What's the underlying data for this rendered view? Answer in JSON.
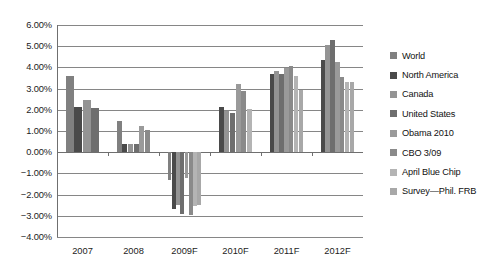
{
  "chart_data": {
    "type": "bar",
    "title": "",
    "subtitle": "",
    "xlabel": "",
    "ylabel": "",
    "ylim": [
      -0.04,
      0.06
    ],
    "ytick_labels": [
      "6.00%",
      "5.00%",
      "4.00%",
      "3.00%",
      "2.00%",
      "1.00%",
      "0.00%",
      "-1.00%",
      "-2.00%",
      "-3.00%",
      "-4.00%"
    ],
    "ytick_values": [
      0.06,
      0.05,
      0.04,
      0.03,
      0.02,
      0.01,
      0.0,
      -0.01,
      -0.02,
      -0.03,
      -0.04
    ],
    "grid": true,
    "legend_position": "right",
    "categories": [
      "2007",
      "2008",
      "2009F",
      "2010F",
      "2011F",
      "2012F"
    ],
    "series": [
      {
        "name": "World",
        "color": "#808080",
        "values": [
          3.6,
          1.45,
          -1.3,
          null,
          null,
          null
        ]
      },
      {
        "name": "North America",
        "color": "#4a4a4a",
        "values": [
          2.15,
          0.4,
          -2.7,
          2.15,
          3.7,
          4.35
        ]
      },
      {
        "name": "Canada",
        "color": "#949494",
        "values": [
          2.45,
          0.4,
          -2.5,
          1.95,
          3.85,
          5.05
        ]
      },
      {
        "name": "United States",
        "color": "#6e6e6e",
        "values": [
          2.1,
          0.4,
          -2.9,
          1.85,
          3.7,
          5.3
        ]
      },
      {
        "name": "Obama 2010",
        "color": "#9a9a9a",
        "values": [
          null,
          1.25,
          -1.2,
          3.2,
          3.95,
          4.25
        ]
      },
      {
        "name": "CBO 3/09",
        "color": "#8a8a8a",
        "values": [
          null,
          1.05,
          -2.95,
          2.9,
          4.05,
          3.55
        ]
      },
      {
        "name": "April Blue Chip",
        "color": "#b4b4b4",
        "values": [
          null,
          null,
          -2.55,
          2.05,
          3.6,
          3.3
        ]
      },
      {
        "name": "Survey—Phil. FRB",
        "color": "#a8a8a8",
        "values": [
          null,
          null,
          -2.5,
          null,
          2.95,
          3.3
        ]
      }
    ]
  },
  "legend": {
    "items": [
      {
        "label": "World"
      },
      {
        "label": "North America"
      },
      {
        "label": "Canada"
      },
      {
        "label": "United States"
      },
      {
        "label": "Obama 2010"
      },
      {
        "label": "CBO 3/09"
      },
      {
        "label": "April Blue Chip"
      },
      {
        "label": "Survey—Phil. FRB"
      }
    ]
  },
  "colors": {
    "gridline": "#868686",
    "axis": "#6f6f6f",
    "text": "#1c1c1c",
    "background": "#ffffff"
  }
}
